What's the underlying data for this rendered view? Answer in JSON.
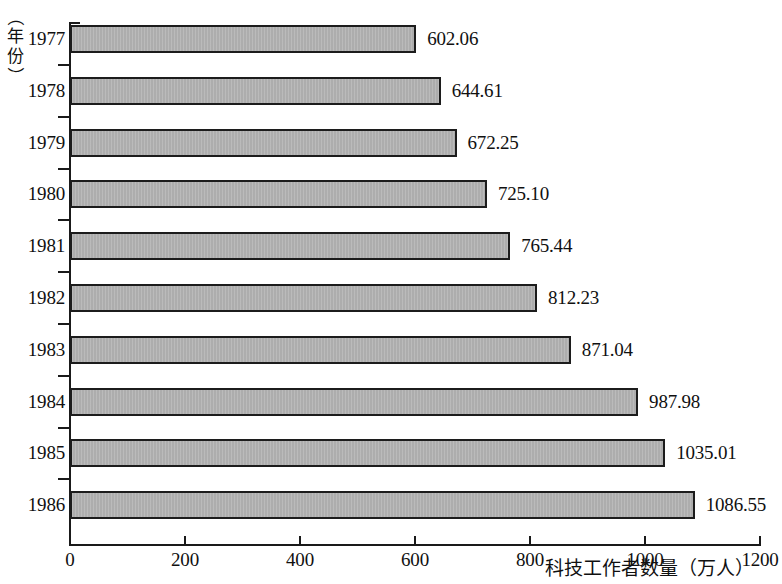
{
  "chart_data": {
    "type": "bar",
    "orientation": "horizontal",
    "title": "",
    "xlabel": "科技工作者数量（万人）",
    "ylabel": "（年份）",
    "categories": [
      "1977",
      "1978",
      "1979",
      "1980",
      "1981",
      "1982",
      "1983",
      "1984",
      "1985",
      "1986"
    ],
    "values": [
      602.06,
      644.61,
      672.25,
      725.1,
      765.44,
      812.23,
      871.04,
      987.98,
      1035.01,
      1086.55
    ],
    "value_labels": [
      "602.06",
      "644.61",
      "672.25",
      "725.10",
      "765.44",
      "812.23",
      "871.04",
      "987.98",
      "1035.01",
      "1086.55"
    ],
    "xticks": [
      0,
      200,
      400,
      600,
      800,
      1000,
      1200
    ],
    "xtick_labels": [
      "0",
      "200",
      "400",
      "600",
      "800",
      "1000",
      "1200"
    ],
    "xlim": [
      0,
      1200
    ],
    "grid": false,
    "legend": false,
    "bar_fill_color": "#b3b3b3",
    "bar_border_color": "#1c1c1c",
    "axis_color": "#1a1a1a",
    "background_color": "#ffffff"
  },
  "ylabel_chars": [
    "（",
    "年",
    "份",
    "）"
  ]
}
